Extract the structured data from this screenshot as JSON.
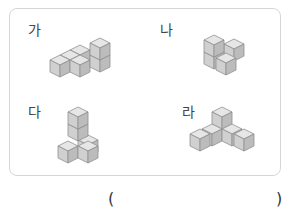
{
  "question": {
    "options": [
      {
        "label": "가",
        "description": "stacked cube figure A"
      },
      {
        "label": "나",
        "description": "stacked cube figure B"
      },
      {
        "label": "다",
        "description": "stacked cube figure C"
      },
      {
        "label": "라",
        "description": "stacked cube figure D"
      }
    ],
    "answer_box": {
      "open": "(",
      "close": ")",
      "value": ""
    }
  },
  "colors": {
    "panel_border": "#d6d6d6",
    "cube_top": "#e6e6e6",
    "cube_left": "#d0d0d0",
    "cube_right": "#bcbcbc",
    "cube_edge": "#8f8f8f"
  }
}
